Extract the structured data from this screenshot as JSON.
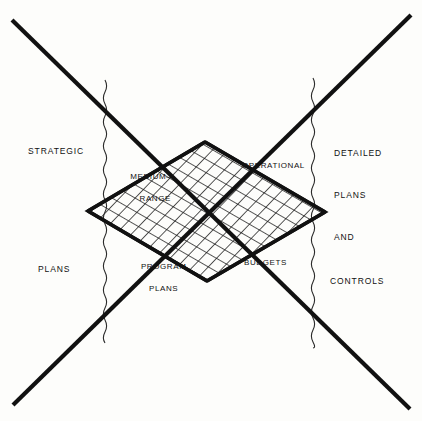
{
  "diagram": {
    "type": "schematic-diagram",
    "background_color": "#fdfdfb",
    "stroke_color": "#111111",
    "axis_labels": {
      "left": [
        {
          "id": "strategic",
          "text": "STRATEGIC",
          "x": 28,
          "y": 146
        },
        {
          "id": "plans-left",
          "text": "PLANS",
          "x": 38,
          "y": 264
        }
      ],
      "right": [
        {
          "id": "detailed",
          "text": "DETAILED",
          "x": 334,
          "y": 148
        },
        {
          "id": "plans-right",
          "text": "PLANS",
          "x": 334,
          "y": 190
        },
        {
          "id": "and",
          "text": "AND",
          "x": 334,
          "y": 232
        },
        {
          "id": "controls",
          "text": "CONTROLS",
          "x": 330,
          "y": 276
        }
      ]
    },
    "mesh_labels": [
      {
        "id": "medium-range",
        "line1": "MEDIUM—",
        "line2": "RANGE",
        "x": 119,
        "y": 160
      },
      {
        "id": "operational",
        "text": "OPERATIONAL",
        "x": 242,
        "y": 160
      },
      {
        "id": "program-plans",
        "line1": "PROGRAM",
        "line2": "PLANS",
        "x": 128,
        "y": 250
      },
      {
        "id": "budgets",
        "text": "BUDGETS",
        "x": 244,
        "y": 257
      }
    ],
    "x_lines": [
      {
        "id": "descending-line",
        "from": [
          12,
          20
        ],
        "to": [
          410,
          409
        ]
      },
      {
        "id": "ascending-line",
        "from": [
          13,
          405
        ],
        "to": [
          411,
          15
        ]
      }
    ],
    "wavy_lines": [
      {
        "id": "wavy-left",
        "x": 105,
        "y_start": 80,
        "y_end": 345
      },
      {
        "id": "wavy-right",
        "x": 313,
        "y_start": 78,
        "y_end": 348
      }
    ],
    "mesh_plane": {
      "id": "crosshatch-diamond",
      "corners": {
        "top": [
          205,
          142
        ],
        "right": [
          325,
          212
        ],
        "bottom": [
          207,
          281
        ],
        "left": [
          88,
          211
        ]
      },
      "fill_pattern": "diagonal-crosshatch"
    }
  }
}
